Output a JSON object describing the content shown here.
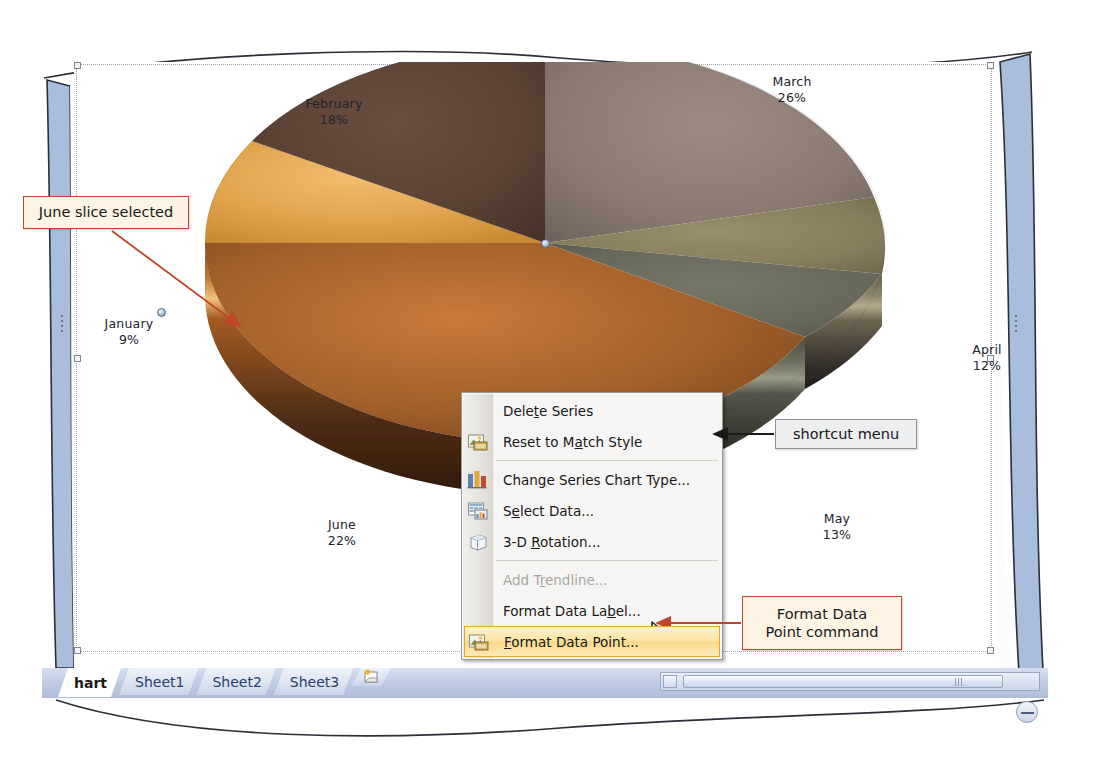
{
  "figure": {
    "app": "Microsoft Excel"
  },
  "chart_data": {
    "type": "pie",
    "title": "",
    "categories": [
      "January",
      "February",
      "March",
      "April",
      "May",
      "June"
    ],
    "values": [
      9,
      18,
      26,
      12,
      13,
      22
    ],
    "value_suffix": "%",
    "labels": [
      {
        "name": "January",
        "pct": "9%",
        "value": 9,
        "color": "#e8a33d"
      },
      {
        "name": "February",
        "pct": "18%",
        "value": 18,
        "color": "#5d4336"
      },
      {
        "name": "March",
        "pct": "26%",
        "value": 26,
        "color": "#8b7a72"
      },
      {
        "name": "April",
        "pct": "12%",
        "value": 12,
        "color": "#8a7f5f"
      },
      {
        "name": "May",
        "pct": "13%",
        "value": 13,
        "color": "#6b6b5b"
      },
      {
        "name": "June",
        "pct": "22%",
        "value": 22,
        "color": "#a5622b"
      }
    ],
    "legend": "none",
    "data_labels": "category name and percentage",
    "selected_slice": "June",
    "chart_style": "3-D pie with bevel",
    "grid": false
  },
  "shortcut_menu": {
    "name": "shortcut menu",
    "items": [
      {
        "label": "Delete Series",
        "accel": "t",
        "icon": "none",
        "state": "enabled"
      },
      {
        "label": "Reset to Match Style",
        "accel": "a",
        "icon": "reset-style-icon",
        "state": "enabled"
      },
      {
        "label": "Change Series Chart Type...",
        "accel": "g",
        "icon": "chart-type-icon",
        "state": "enabled"
      },
      {
        "label": "Select Data...",
        "accel": "e",
        "icon": "select-data-icon",
        "state": "enabled"
      },
      {
        "label": "3-D Rotation...",
        "accel": "R",
        "icon": "rotation-icon",
        "state": "enabled"
      },
      {
        "label": "Add Trendline...",
        "accel": "r",
        "icon": "none",
        "state": "disabled"
      },
      {
        "label": "Format Data Label...",
        "accel": "b",
        "icon": "none",
        "state": "enabled"
      },
      {
        "label": "Format Data Point...",
        "accel": "F",
        "icon": "format-point-icon",
        "state": "selected"
      }
    ]
  },
  "callouts": [
    {
      "id": "june-slice",
      "text": "June slice selected",
      "style": "cream"
    },
    {
      "id": "shortcut",
      "text": "shortcut menu",
      "style": "gray"
    },
    {
      "id": "format-cmd",
      "line1": "Format Data",
      "line2": "Point command",
      "style": "cream"
    }
  ],
  "sheet_tabs": {
    "tabs": [
      {
        "label": "hart",
        "active": true
      },
      {
        "label": "Sheet1",
        "active": false
      },
      {
        "label": "Sheet2",
        "active": false
      },
      {
        "label": "Sheet3",
        "active": false
      }
    ],
    "insert_sheet_icon": "insert-worksheet-icon"
  },
  "colors": {
    "callout_border": "#c0452a",
    "callout_fill": "#fdf4e3",
    "menu_highlight": "#f8d98b",
    "menu_highlight_border": "#e8a33d",
    "tabbar": "#aebcd8"
  }
}
